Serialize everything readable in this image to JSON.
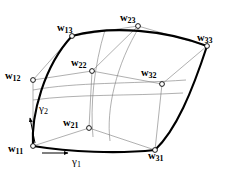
{
  "figure": {
    "background_color": "#ffffff",
    "ink_color": "#000000",
    "net_color": "#7a7a7a",
    "boundary_width": 2.1,
    "net_width": 0.6,
    "marker_radius": 2.4
  },
  "control_points": [
    {
      "id": "w11",
      "base": "w",
      "sub": "11",
      "x": 33,
      "y": 146,
      "label_x": 8,
      "label_y": 139,
      "corner": true
    },
    {
      "id": "w12",
      "base": "w",
      "sub": "12",
      "x": 33,
      "y": 80,
      "label_x": 5,
      "label_y": 66,
      "corner": false
    },
    {
      "id": "w13",
      "base": "w",
      "sub": "13",
      "x": 72,
      "y": 36,
      "label_x": 57,
      "label_y": 18,
      "corner": true
    },
    {
      "id": "w21",
      "base": "w",
      "sub": "21",
      "x": 89,
      "y": 128,
      "label_x": 63,
      "label_y": 113,
      "corner": false
    },
    {
      "id": "w22",
      "base": "w",
      "sub": "22",
      "x": 92,
      "y": 71,
      "label_x": 71,
      "label_y": 53,
      "corner": false
    },
    {
      "id": "w23",
      "base": "w",
      "sub": "23",
      "x": 138,
      "y": 26,
      "label_x": 120,
      "label_y": 8,
      "corner": false
    },
    {
      "id": "w31",
      "base": "w",
      "sub": "31",
      "x": 155,
      "y": 150,
      "label_x": 148,
      "label_y": 146,
      "corner": true
    },
    {
      "id": "w32",
      "base": "w",
      "sub": "32",
      "x": 162,
      "y": 84,
      "label_x": 141,
      "label_y": 63,
      "corner": false
    },
    {
      "id": "w33",
      "base": "w",
      "sub": "33",
      "x": 207,
      "y": 46,
      "label_x": 197,
      "label_y": 28,
      "corner": true
    }
  ],
  "parameter_arrows": [
    {
      "id": "gamma1",
      "base": "γ",
      "sub": "1",
      "label_x": 72,
      "label_y": 152,
      "from_x": 42,
      "from_y": 153,
      "to_x": 68,
      "to_y": 153
    },
    {
      "id": "gamma2",
      "base": "γ",
      "sub": "2",
      "label_x": 39,
      "label_y": 99,
      "from_x": 35,
      "from_y": 143,
      "to_x": 30,
      "to_y": 118
    }
  ],
  "boundary_curves": [
    {
      "id": "edge-bottom",
      "path": "M 33,146 C 70,152 118,154 155,150"
    },
    {
      "id": "edge-right",
      "path": "M 155,150 C 176,130 192,92 207,46"
    },
    {
      "id": "edge-top",
      "path": "M 72,36 C 112,25 165,30 207,46"
    },
    {
      "id": "edge-left",
      "path": "M 33,146 C 31,115 44,66 72,36"
    }
  ],
  "interior_curves": [
    {
      "id": "iso-u-mid",
      "path": "M 33,100 C 76,94 129,96 183,93"
    },
    {
      "id": "iso-u-low",
      "path": "M 33,90 C 76,82 130,84 186,80"
    },
    {
      "id": "iso-v-mid",
      "path": "M 93,137 C 90,106 94,66 105,30"
    },
    {
      "id": "iso-v-right",
      "path": "M 110,141 C 106,110 116,64 140,26"
    }
  ],
  "net_lines": [
    {
      "id": "net-w11-w12",
      "x1": 33,
      "y1": 146,
      "x2": 33,
      "y2": 80
    },
    {
      "id": "net-w12-w13",
      "x1": 33,
      "y1": 80,
      "x2": 72,
      "y2": 36
    },
    {
      "id": "net-w11-w21",
      "x1": 33,
      "y1": 146,
      "x2": 89,
      "y2": 128
    },
    {
      "id": "net-w21-w31",
      "x1": 89,
      "y1": 128,
      "x2": 155,
      "y2": 150
    },
    {
      "id": "net-w13-w23",
      "x1": 72,
      "y1": 36,
      "x2": 138,
      "y2": 26
    },
    {
      "id": "net-w23-w33",
      "x1": 138,
      "y1": 26,
      "x2": 207,
      "y2": 46
    },
    {
      "id": "net-w31-w32",
      "x1": 155,
      "y1": 150,
      "x2": 162,
      "y2": 84
    },
    {
      "id": "net-w32-w33",
      "x1": 162,
      "y1": 84,
      "x2": 207,
      "y2": 46
    },
    {
      "id": "net-w12-w22",
      "x1": 33,
      "y1": 80,
      "x2": 92,
      "y2": 71
    },
    {
      "id": "net-w22-w32",
      "x1": 92,
      "y1": 71,
      "x2": 162,
      "y2": 84
    },
    {
      "id": "net-w21-w22",
      "x1": 89,
      "y1": 128,
      "x2": 92,
      "y2": 71
    },
    {
      "id": "net-w22-w23",
      "x1": 92,
      "y1": 71,
      "x2": 138,
      "y2": 26
    }
  ]
}
